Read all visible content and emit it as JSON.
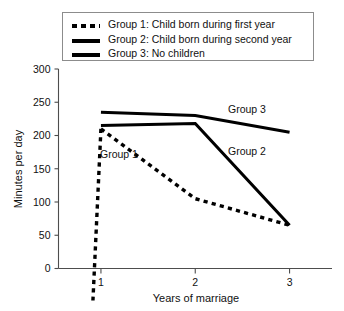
{
  "chart_data": {
    "type": "line",
    "title": "",
    "xlabel": "Years of marriage",
    "ylabel": "Minutes per day",
    "x": [
      1,
      2,
      3
    ],
    "xtick_labels": [
      "1",
      "2",
      "3"
    ],
    "ytick_labels": [
      "0",
      "50",
      "100",
      "150",
      "200",
      "250",
      "300"
    ],
    "ytick_values": [
      0,
      50,
      100,
      150,
      200,
      250,
      300
    ],
    "xlim": [
      0.55,
      3.45
    ],
    "ylim": [
      0,
      300
    ],
    "grid": false,
    "legend_position": "top",
    "series": [
      {
        "name": "Group 1",
        "legend_label": "Group 1: Child born during first year",
        "style": "dotted",
        "color": "#000000",
        "values": [
          210,
          105,
          65
        ]
      },
      {
        "name": "Group 2",
        "legend_label": "Group 2: Child born during second year",
        "style": "solid",
        "color": "#000000",
        "values": [
          215,
          218,
          65
        ]
      },
      {
        "name": "Group 3",
        "legend_label": "Group 3: No children",
        "style": "solid",
        "color": "#000000",
        "values": [
          235,
          230,
          205
        ]
      }
    ],
    "annotations": [
      {
        "text": "Group 1",
        "x_px": 100,
        "y_px": 158
      },
      {
        "text": "Group 2",
        "x_px": 228,
        "y_px": 155
      },
      {
        "text": "Group 3",
        "x_px": 228,
        "y_px": 113
      }
    ]
  },
  "legend": {
    "items": [
      {
        "label": "Group 1: Child born during first year",
        "style": "dotted"
      },
      {
        "label": "Group 2: Child born during second year",
        "style": "solid"
      },
      {
        "label": "Group 3: No children",
        "style": "solid"
      }
    ]
  }
}
